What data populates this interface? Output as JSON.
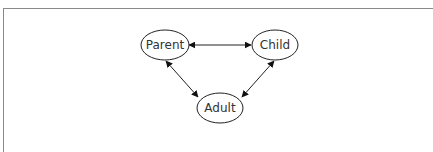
{
  "diagram": {
    "type": "relationship-triangle",
    "nodes": [
      {
        "id": "parent",
        "label": "Parent",
        "cx": 165,
        "cy": 45
      },
      {
        "id": "child",
        "label": "Child",
        "cx": 275,
        "cy": 45
      },
      {
        "id": "adult",
        "label": "Adult",
        "cx": 220,
        "cy": 108
      }
    ],
    "edges": [
      {
        "from": "parent",
        "to": "child",
        "direction": "bidirectional"
      },
      {
        "from": "parent",
        "to": "adult",
        "direction": "bidirectional"
      },
      {
        "from": "child",
        "to": "adult",
        "direction": "bidirectional"
      }
    ],
    "colors": {
      "stroke": "#222222",
      "text": "#333333",
      "frame": "#8a8a8a"
    }
  }
}
